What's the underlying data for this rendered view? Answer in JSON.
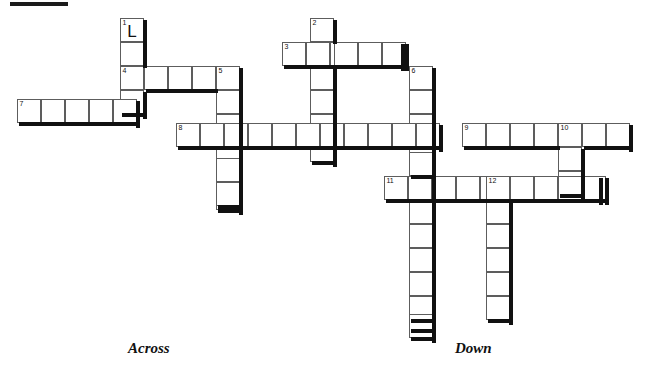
{
  "page": {
    "background_color": "#ffffff",
    "grid_line_color": "#5d5d5d",
    "grid_edge_color": "#111111",
    "cell_size_px": 24
  },
  "corner_mark": {
    "name": "top-left-marker",
    "x": 10,
    "y": 2,
    "width": 58,
    "height": 4,
    "color": "#1b1b1b"
  },
  "captions": [
    {
      "label": "Across",
      "x": 128,
      "y": 349
    },
    {
      "label": "Down",
      "x": 455,
      "y": 349
    }
  ],
  "entries": [
    {
      "number": "1",
      "direction": "down",
      "x": 120,
      "y": 18,
      "length": 4
    },
    {
      "number": "2",
      "direction": "down",
      "x": 310,
      "y": 18,
      "length": 6
    },
    {
      "number": "3",
      "direction": "across",
      "x": 282,
      "y": 42,
      "length": 5
    },
    {
      "number": "4",
      "direction": "across",
      "x": 120,
      "y": 66,
      "length": 5
    },
    {
      "number": "5",
      "direction": "down",
      "x": 216,
      "y": 66,
      "length": 6
    },
    {
      "number": "6",
      "direction": "down",
      "x": 409,
      "y": 66,
      "length": 11
    },
    {
      "number": "7",
      "direction": "across",
      "x": 17,
      "y": 99,
      "length": 5
    },
    {
      "number": "8",
      "direction": "across",
      "x": 176,
      "y": 123,
      "length": 11
    },
    {
      "number": "9",
      "direction": "across",
      "x": 462,
      "y": 123,
      "length": 7
    },
    {
      "number": "10",
      "direction": "down",
      "x": 558,
      "y": 123,
      "length": 3
    },
    {
      "number": "11",
      "direction": "across",
      "x": 384,
      "y": 176,
      "length": 9
    },
    {
      "number": "12",
      "direction": "down",
      "x": 486,
      "y": 176,
      "length": 6
    }
  ],
  "letters": [
    {
      "value": "L",
      "x": 120,
      "y": 18
    }
  ],
  "cells": [
    {
      "x": 120,
      "y": 18,
      "num": "1"
    },
    {
      "x": 120,
      "y": 42,
      "num": ""
    },
    {
      "x": 120,
      "y": 66,
      "num": "4"
    },
    {
      "x": 120,
      "y": 90,
      "num": ""
    },
    {
      "x": 310,
      "y": 18,
      "num": "2"
    },
    {
      "x": 310,
      "y": 42,
      "num": ""
    },
    {
      "x": 310,
      "y": 66,
      "num": ""
    },
    {
      "x": 310,
      "y": 90,
      "num": ""
    },
    {
      "x": 310,
      "y": 114,
      "num": ""
    },
    {
      "x": 310,
      "y": 138,
      "num": ""
    },
    {
      "x": 282,
      "y": 42,
      "num": "3"
    },
    {
      "x": 334,
      "y": 42,
      "num": ""
    },
    {
      "x": 358,
      "y": 42,
      "num": ""
    },
    {
      "x": 382,
      "y": 42,
      "num": ""
    },
    {
      "x": 144,
      "y": 66,
      "num": ""
    },
    {
      "x": 168,
      "y": 66,
      "num": ""
    },
    {
      "x": 192,
      "y": 66,
      "num": ""
    },
    {
      "x": 216,
      "y": 66,
      "num": "5"
    },
    {
      "x": 216,
      "y": 90,
      "num": ""
    },
    {
      "x": 216,
      "y": 114,
      "num": ""
    },
    {
      "x": 216,
      "y": 138,
      "num": ""
    },
    {
      "x": 216,
      "y": 158,
      "num": ""
    },
    {
      "x": 216,
      "y": 182,
      "num": ""
    },
    {
      "x": 409,
      "y": 66,
      "num": "6"
    },
    {
      "x": 409,
      "y": 90,
      "num": ""
    },
    {
      "x": 409,
      "y": 114,
      "num": ""
    },
    {
      "x": 409,
      "y": 138,
      "num": ""
    },
    {
      "x": 409,
      "y": 152,
      "num": ""
    },
    {
      "x": 409,
      "y": 200,
      "num": ""
    },
    {
      "x": 409,
      "y": 224,
      "num": ""
    },
    {
      "x": 409,
      "y": 248,
      "num": ""
    },
    {
      "x": 409,
      "y": 272,
      "num": ""
    },
    {
      "x": 409,
      "y": 296,
      "num": ""
    },
    {
      "x": 409,
      "y": 314,
      "num": ""
    },
    {
      "x": 17,
      "y": 99,
      "num": "7"
    },
    {
      "x": 41,
      "y": 99,
      "num": ""
    },
    {
      "x": 65,
      "y": 99,
      "num": ""
    },
    {
      "x": 89,
      "y": 99,
      "num": ""
    },
    {
      "x": 113,
      "y": 99,
      "num": ""
    },
    {
      "x": 176,
      "y": 123,
      "num": "8"
    },
    {
      "x": 200,
      "y": 123,
      "num": ""
    },
    {
      "x": 224,
      "y": 123,
      "num": ""
    },
    {
      "x": 248,
      "y": 123,
      "num": ""
    },
    {
      "x": 272,
      "y": 123,
      "num": ""
    },
    {
      "x": 296,
      "y": 123,
      "num": ""
    },
    {
      "x": 320,
      "y": 123,
      "num": ""
    },
    {
      "x": 344,
      "y": 123,
      "num": ""
    },
    {
      "x": 368,
      "y": 123,
      "num": ""
    },
    {
      "x": 392,
      "y": 123,
      "num": ""
    },
    {
      "x": 416,
      "y": 123,
      "num": ""
    },
    {
      "x": 462,
      "y": 123,
      "num": "9"
    },
    {
      "x": 486,
      "y": 123,
      "num": ""
    },
    {
      "x": 510,
      "y": 123,
      "num": ""
    },
    {
      "x": 534,
      "y": 123,
      "num": ""
    },
    {
      "x": 558,
      "y": 123,
      "num": "10"
    },
    {
      "x": 582,
      "y": 123,
      "num": ""
    },
    {
      "x": 606,
      "y": 123,
      "num": ""
    },
    {
      "x": 558,
      "y": 147,
      "num": ""
    },
    {
      "x": 558,
      "y": 171,
      "num": ""
    },
    {
      "x": 384,
      "y": 176,
      "num": "11"
    },
    {
      "x": 408,
      "y": 176,
      "num": ""
    },
    {
      "x": 432,
      "y": 176,
      "num": ""
    },
    {
      "x": 456,
      "y": 176,
      "num": ""
    },
    {
      "x": 486,
      "y": 176,
      "num": "12"
    },
    {
      "x": 510,
      "y": 176,
      "num": ""
    },
    {
      "x": 534,
      "y": 176,
      "num": ""
    },
    {
      "x": 558,
      "y": 176,
      "num": ""
    },
    {
      "x": 582,
      "y": 176,
      "num": ""
    },
    {
      "x": 486,
      "y": 200,
      "num": ""
    },
    {
      "x": 486,
      "y": 224,
      "num": ""
    },
    {
      "x": 486,
      "y": 248,
      "num": ""
    },
    {
      "x": 486,
      "y": 272,
      "num": ""
    },
    {
      "x": 486,
      "y": 296,
      "num": ""
    }
  ]
}
